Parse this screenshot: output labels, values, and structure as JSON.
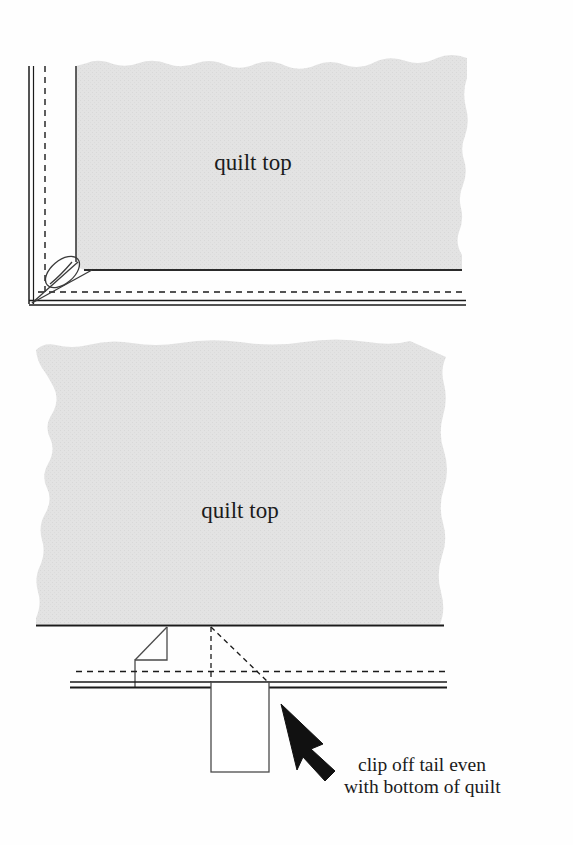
{
  "page": {
    "background_color": "#fefefe",
    "ink_color": "#1b1b1b",
    "fabric_fill_color": "#e3e3e3",
    "fabric_edge_color": "#1e1e1e"
  },
  "figures": [
    {
      "id": "figure-top",
      "name": "mitered-corner-figure",
      "quilt_label": "quilt top",
      "elements": [
        {
          "name": "binding-double-line-left",
          "kind": "double-line",
          "orientation": "vertical"
        },
        {
          "name": "stitching-dashed-line-left",
          "kind": "dashed-line",
          "orientation": "vertical"
        },
        {
          "name": "binding-double-line-bottom",
          "kind": "double-line",
          "orientation": "horizontal"
        },
        {
          "name": "stitching-dashed-line-bottom",
          "kind": "dashed-line",
          "orientation": "horizontal"
        },
        {
          "name": "miter-fold-loop",
          "kind": "fold-loop"
        },
        {
          "name": "quilt-top-fabric",
          "kind": "torn-fabric-patch"
        }
      ]
    },
    {
      "id": "figure-bottom",
      "name": "clip-tail-figure",
      "quilt_label": "quilt top",
      "callout": {
        "lines": [
          "clip off tail even",
          "with bottom of quilt"
        ]
      },
      "elements": [
        {
          "name": "quilt-top-fabric",
          "kind": "torn-fabric-patch"
        },
        {
          "name": "quilt-bottom-edge-line",
          "kind": "solid-line"
        },
        {
          "name": "binding-fold-flap",
          "kind": "folded-flap"
        },
        {
          "name": "binding-tail-fold-guide",
          "kind": "dashed-triangle"
        },
        {
          "name": "stitching-dashed-line",
          "kind": "dashed-line",
          "orientation": "horizontal"
        },
        {
          "name": "binding-double-line",
          "kind": "double-line",
          "orientation": "horizontal"
        },
        {
          "name": "binding-tail-rectangle",
          "kind": "rectangle"
        },
        {
          "name": "callout-arrow",
          "kind": "arrow",
          "direction": "up-left"
        }
      ]
    }
  ]
}
